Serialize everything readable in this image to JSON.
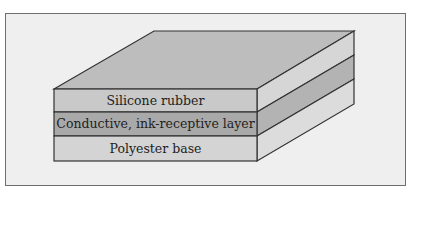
{
  "figure": {
    "type": "layered-cross-section",
    "layers": [
      {
        "label": "Silicone rubber",
        "front_color": "#c9c9c9",
        "side_color": "#d6d6d6"
      },
      {
        "label": "Conductive, ink-receptive layer",
        "front_color": "#a9a9a9",
        "side_color": "#b3b3b3"
      },
      {
        "label": "Polyester base",
        "front_color": "#d4d4d4",
        "side_color": "#dcdcdc"
      }
    ],
    "top_color": "#bdbdbd",
    "frame_background": "#efefef",
    "outline_color": "#333333"
  }
}
